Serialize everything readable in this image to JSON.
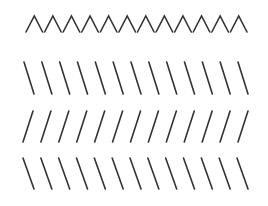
{
  "stimulus": {
    "background": "#ffffff",
    "stroke_color": "#333333",
    "stroke_width": 1.6,
    "rows": [
      {
        "name": "chevron-row",
        "shape": "chevron-up",
        "count": 12,
        "x_start": 25,
        "x_end": 248,
        "y_top": 16,
        "y_bottom": 32
      },
      {
        "name": "backslash-row-1",
        "shape": "backslash",
        "count": 13,
        "x_start": 24,
        "x_end": 248,
        "y_top": 62,
        "y_bottom": 94,
        "slant": 10
      },
      {
        "name": "slash-row",
        "shape": "slash",
        "count": 13,
        "x_start": 23,
        "x_end": 248,
        "y_top": 111,
        "y_bottom": 142,
        "slant": 10
      },
      {
        "name": "backslash-row-2",
        "shape": "backslash",
        "count": 13,
        "x_start": 23,
        "x_end": 248,
        "y_top": 158,
        "y_bottom": 189,
        "slant": 11
      }
    ]
  }
}
